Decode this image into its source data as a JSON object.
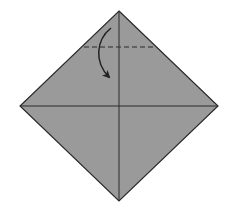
{
  "diagram": {
    "type": "origami-fold-step",
    "paper": {
      "shape": "diamond",
      "fill": "#9a9a9a",
      "stroke": "#2a2a2a",
      "vertices": {
        "top": [
          119,
          11
        ],
        "left": [
          20,
          106
        ],
        "right": [
          218,
          106
        ],
        "bottom": [
          119,
          201
        ]
      }
    },
    "creases": [
      {
        "name": "vertical-crease",
        "from": [
          119,
          11
        ],
        "to": [
          119,
          201
        ]
      },
      {
        "name": "horizontal-crease",
        "from": [
          20,
          106
        ],
        "to": [
          218,
          106
        ]
      }
    ],
    "valley_fold_line": {
      "from": [
        84,
        47
      ],
      "to": [
        153,
        47
      ],
      "style": "dashed"
    },
    "fold_arrow": {
      "from": [
        111,
        28
      ],
      "to": [
        110,
        78
      ],
      "direction": "fold top point down"
    }
  }
}
